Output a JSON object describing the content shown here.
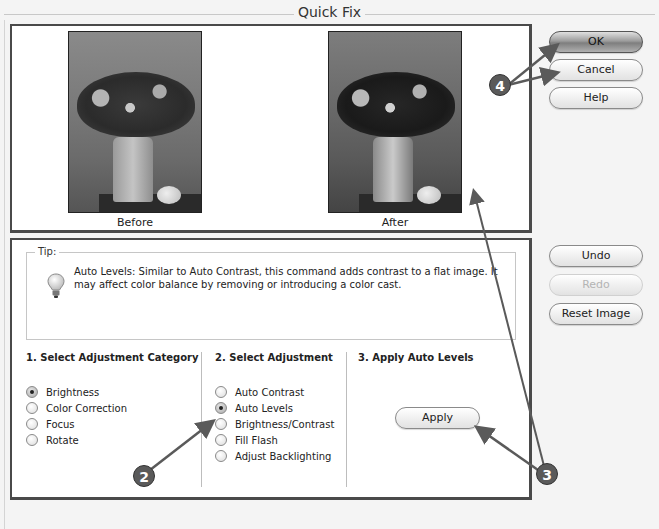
{
  "window": {
    "title": "Quick Fix"
  },
  "preview": {
    "before_label": "Before",
    "after_label": "After"
  },
  "buttons": {
    "ok": "OK",
    "cancel": "Cancel",
    "help": "Help",
    "undo": "Undo",
    "redo": "Redo",
    "reset_image": "Reset Image",
    "apply": "Apply"
  },
  "tip": {
    "legend": "Tip:",
    "icon": "lightbulb-icon",
    "text": "Auto Levels: Similar to Auto Contrast, this command adds contrast to a flat image. It may affect color balance by removing or introducing a color cast."
  },
  "steps": {
    "category": {
      "title": "1. Select Adjustment Category",
      "options": [
        {
          "label": "Brightness",
          "checked": true
        },
        {
          "label": "Color Correction",
          "checked": false
        },
        {
          "label": "Focus",
          "checked": false
        },
        {
          "label": "Rotate",
          "checked": false
        }
      ]
    },
    "adjustment": {
      "title": "2. Select Adjustment",
      "options": [
        {
          "label": "Auto Contrast",
          "checked": false
        },
        {
          "label": "Auto Levels",
          "checked": true
        },
        {
          "label": "Brightness/Contrast",
          "checked": false
        },
        {
          "label": "Fill Flash",
          "checked": false
        },
        {
          "label": "Adjust Backlighting",
          "checked": false
        }
      ]
    },
    "apply": {
      "title": "3. Apply Auto Levels"
    }
  },
  "callouts": {
    "two": "2",
    "three": "3",
    "four": "4"
  },
  "colors": {
    "panel_border": "#4a4a4a",
    "callout_fill": "#5a5a5a",
    "disabled_text": "#b4b4b4"
  }
}
